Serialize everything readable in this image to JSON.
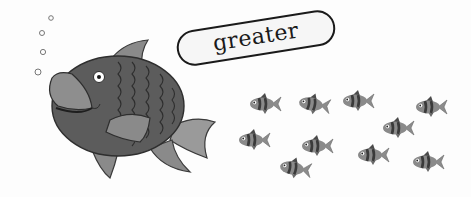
{
  "label": {
    "text": "greater"
  },
  "big_fish": {
    "count": 1,
    "facing": "left",
    "body_color": "#5a5a5a",
    "fin_color": "#8a8a8a"
  },
  "small_fish": {
    "count": 10,
    "facing": "left",
    "positions": [
      {
        "x": 262,
        "y": 104
      },
      {
        "x": 311,
        "y": 104
      },
      {
        "x": 355,
        "y": 101
      },
      {
        "x": 428,
        "y": 107
      },
      {
        "x": 395,
        "y": 128
      },
      {
        "x": 251,
        "y": 140
      },
      {
        "x": 314,
        "y": 146
      },
      {
        "x": 370,
        "y": 155
      },
      {
        "x": 425,
        "y": 162
      },
      {
        "x": 292,
        "y": 168
      }
    ]
  },
  "bubbles": {
    "count": 4
  }
}
